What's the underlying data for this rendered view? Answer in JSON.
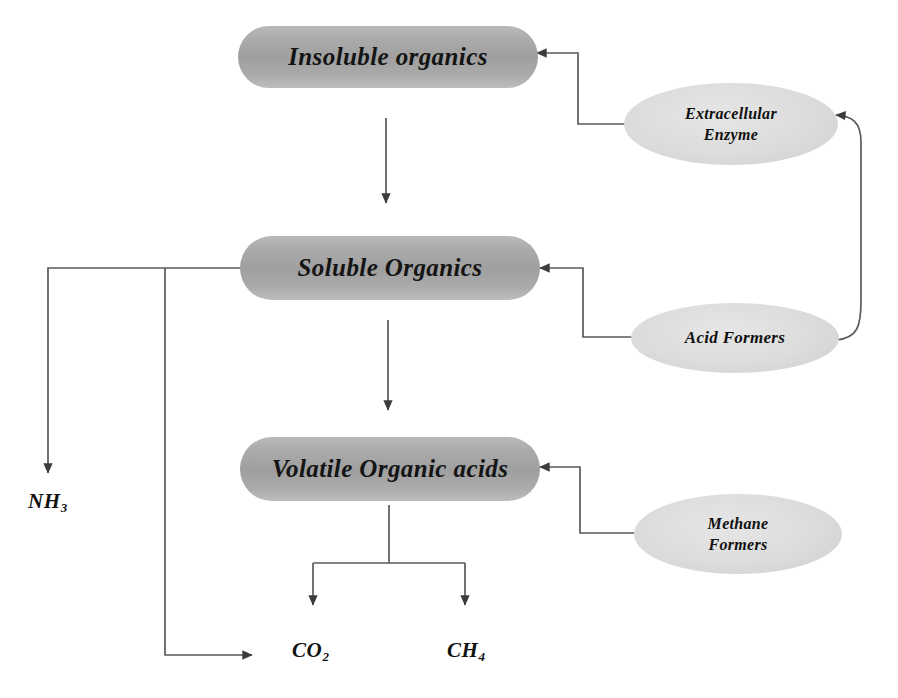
{
  "diagram": {
    "colors": {
      "pill_fill": "#a9a9a9",
      "ellipse_fill": "#dedede",
      "edge_stroke": "#555555",
      "text": "#121212",
      "background": "#ffffff"
    },
    "process_nodes": [
      {
        "id": "insoluble-organics",
        "label": "Insoluble organics",
        "shape": "rounded-pill"
      },
      {
        "id": "soluble-organics",
        "label": "Soluble Organics",
        "shape": "rounded-pill"
      },
      {
        "id": "volatile-organic-acids",
        "label": "Volatile Organic acids",
        "shape": "rounded-pill"
      }
    ],
    "agent_nodes": [
      {
        "id": "extracellular-enzyme",
        "line1": "Extracellular",
        "line2": "Enzyme",
        "shape": "ellipse"
      },
      {
        "id": "acid-formers",
        "line1": "Acid Formers",
        "line2": "",
        "shape": "ellipse"
      },
      {
        "id": "methane-formers",
        "line1": "Methane",
        "line2": "Formers",
        "shape": "ellipse"
      }
    ],
    "product_nodes": [
      {
        "id": "ammonia",
        "symbol": "NH",
        "subscript": "3"
      },
      {
        "id": "carbon-dioxide",
        "symbol": "CO",
        "subscript": "2"
      },
      {
        "id": "methane",
        "symbol": "CH",
        "subscript": "4"
      }
    ],
    "edges": [
      {
        "from": "insoluble-organics",
        "to": "soluble-organics",
        "kind": "arrow-down"
      },
      {
        "from": "soluble-organics",
        "to": "volatile-organic-acids",
        "kind": "arrow-down"
      },
      {
        "from": "extracellular-enzyme",
        "to": "insoluble-organics",
        "kind": "elbow-arrow-left"
      },
      {
        "from": "acid-formers",
        "to": "soluble-organics",
        "kind": "elbow-arrow-left"
      },
      {
        "from": "methane-formers",
        "to": "volatile-organic-acids",
        "kind": "elbow-arrow-left"
      },
      {
        "from": "acid-formers",
        "to": "extracellular-enzyme",
        "kind": "curved-feedback-right"
      },
      {
        "from": "soluble-organics",
        "to": "ammonia",
        "kind": "elbow-arrow-down-left"
      },
      {
        "from": "soluble-organics",
        "to": "carbon-dioxide",
        "kind": "elbow-arrow-bottom-left"
      },
      {
        "from": "volatile-organic-acids",
        "to": "carbon-dioxide",
        "kind": "tee-branch-arrow-down"
      },
      {
        "from": "volatile-organic-acids",
        "to": "methane",
        "kind": "tee-branch-arrow-down"
      }
    ]
  }
}
